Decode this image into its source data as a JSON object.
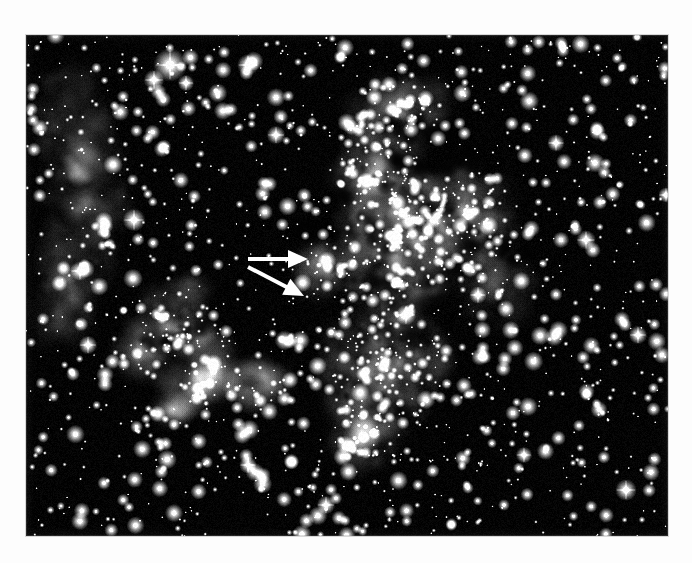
{
  "document": {
    "kind": "astronomical-photograph",
    "title": "",
    "caption": "",
    "background_color": "#ffffff"
  },
  "plate": {
    "name": "star-field-nebula-plate",
    "frame": {
      "x": 26,
      "y": 35,
      "width": 642,
      "height": 501
    },
    "sky_color": "#030303",
    "star_color": "#ffffff",
    "nebula_color": "#d9d9d9",
    "description": "Dense star field with bright emission nebulosity; large complex nebula right of centre, smaller detached patches at lower left and along the left edge."
  },
  "annotations": {
    "arrow_color": "#ffffff",
    "items": [
      {
        "name": "upper-arrow",
        "label": "",
        "x1": 248,
        "y1": 259,
        "x2": 308,
        "y2": 259,
        "shaft_width": 4,
        "head_length": 20,
        "head_width": 18,
        "direction": "right"
      },
      {
        "name": "lower-arrow",
        "label": "",
        "x1": 248,
        "y1": 267,
        "x2": 304,
        "y2": 296,
        "shaft_width": 4,
        "head_length": 20,
        "head_width": 18,
        "direction": "down-right"
      }
    ]
  },
  "chart_data": {
    "type": "scatter",
    "title": "",
    "xlabel": "",
    "ylabel": "",
    "nebulae": [
      {
        "name": "left-edge-filament",
        "cx": 55,
        "cy": 140,
        "rx": 42,
        "ry": 115,
        "rot": -8,
        "brightness": 0.52
      },
      {
        "name": "left-edge-lower",
        "cx": 40,
        "cy": 250,
        "rx": 30,
        "ry": 70,
        "rot": 5,
        "brightness": 0.4
      },
      {
        "name": "lower-left-wisp-a",
        "cx": 140,
        "cy": 280,
        "rx": 48,
        "ry": 26,
        "rot": -35,
        "brightness": 0.62
      },
      {
        "name": "lower-left-wisp-b",
        "cx": 170,
        "cy": 305,
        "rx": 34,
        "ry": 20,
        "rot": 20,
        "brightness": 0.55
      },
      {
        "name": "lower-left-knot",
        "cx": 118,
        "cy": 320,
        "rx": 26,
        "ry": 18,
        "rot": 10,
        "brightness": 0.6
      },
      {
        "name": "lower-left-blob-c",
        "cx": 175,
        "cy": 345,
        "rx": 42,
        "ry": 24,
        "rot": -10,
        "brightness": 0.68
      },
      {
        "name": "lower-left-blob-d",
        "cx": 228,
        "cy": 348,
        "rx": 30,
        "ry": 22,
        "rot": 0,
        "brightness": 0.72
      },
      {
        "name": "lower-left-small-e",
        "cx": 148,
        "cy": 375,
        "rx": 16,
        "ry": 11,
        "rot": 0,
        "brightness": 0.5
      },
      {
        "name": "arrow-target-knot",
        "cx": 295,
        "cy": 233,
        "rx": 26,
        "ry": 28,
        "rot": 0,
        "brightness": 0.55
      },
      {
        "name": "main-nebula-north",
        "cx": 372,
        "cy": 80,
        "rx": 52,
        "ry": 36,
        "rot": -20,
        "brightness": 0.58
      },
      {
        "name": "main-nebula-upper",
        "cx": 352,
        "cy": 140,
        "rx": 44,
        "ry": 40,
        "rot": 15,
        "brightness": 0.66
      },
      {
        "name": "main-nebula-core",
        "cx": 370,
        "cy": 205,
        "rx": 62,
        "ry": 72,
        "rot": 0,
        "brightness": 0.86
      },
      {
        "name": "main-nebula-east",
        "cx": 440,
        "cy": 185,
        "rx": 48,
        "ry": 52,
        "rot": 10,
        "brightness": 0.72
      },
      {
        "name": "main-nebula-south",
        "cx": 358,
        "cy": 330,
        "rx": 62,
        "ry": 70,
        "rot": 0,
        "brightness": 0.78
      },
      {
        "name": "main-nebula-tail",
        "cx": 340,
        "cy": 400,
        "rx": 34,
        "ry": 36,
        "rot": 0,
        "brightness": 0.6
      },
      {
        "name": "right-faint-haze",
        "cx": 470,
        "cy": 250,
        "rx": 40,
        "ry": 44,
        "rot": 0,
        "brightness": 0.3
      }
    ],
    "bright_stars": [
      {
        "x": 144,
        "y": 30,
        "r": 6.5
      },
      {
        "x": 128,
        "y": 45,
        "r": 4.0
      },
      {
        "x": 160,
        "y": 48,
        "r": 3.2
      },
      {
        "x": 222,
        "y": 30,
        "r": 4.2
      },
      {
        "x": 250,
        "y": 100,
        "r": 3.6
      },
      {
        "x": 108,
        "y": 185,
        "r": 4.4
      },
      {
        "x": 62,
        "y": 310,
        "r": 3.6
      },
      {
        "x": 54,
        "y": 236,
        "r": 3.8
      },
      {
        "x": 380,
        "y": 280,
        "r": 4.0
      },
      {
        "x": 452,
        "y": 260,
        "r": 3.4
      },
      {
        "x": 560,
        "y": 205,
        "r": 3.8
      },
      {
        "x": 612,
        "y": 300,
        "r": 3.6
      },
      {
        "x": 600,
        "y": 455,
        "r": 4.2
      },
      {
        "x": 222,
        "y": 430,
        "r": 3.4
      },
      {
        "x": 300,
        "y": 470,
        "r": 3.6
      },
      {
        "x": 498,
        "y": 420,
        "r": 3.2
      },
      {
        "x": 530,
        "y": 108,
        "r": 3.4
      },
      {
        "x": 640,
        "y": 160,
        "r": 3.0
      }
    ],
    "star_count_estimate": 1400
  }
}
